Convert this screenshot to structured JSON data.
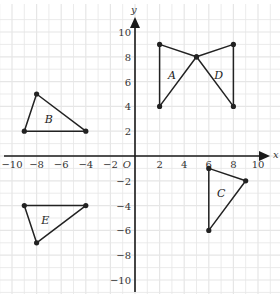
{
  "chart_data": {
    "type": "scatter",
    "title": "",
    "xlabel": "x",
    "ylabel": "y",
    "xlim": [
      -10,
      10
    ],
    "ylim": [
      -10,
      10
    ],
    "grid": true,
    "x_ticks": [
      -10,
      -8,
      -6,
      -4,
      -2,
      2,
      4,
      6,
      8,
      10
    ],
    "y_ticks": [
      -10,
      -8,
      -6,
      -4,
      -2,
      2,
      4,
      6,
      8,
      10
    ],
    "origin_label": "O",
    "shapes": [
      {
        "name": "A",
        "type": "triangle",
        "vertices": [
          [
            2,
            9
          ],
          [
            5,
            8
          ],
          [
            2,
            4
          ]
        ],
        "label_pos": [
          3,
          6.5
        ]
      },
      {
        "name": "B",
        "type": "triangle",
        "vertices": [
          [
            -8,
            5
          ],
          [
            -4,
            2
          ],
          [
            -9,
            2
          ]
        ],
        "label_pos": [
          -7,
          3
        ]
      },
      {
        "name": "C",
        "type": "triangle",
        "vertices": [
          [
            6,
            -1
          ],
          [
            9,
            -2
          ],
          [
            6,
            -6
          ]
        ],
        "label_pos": [
          7,
          -3
        ]
      },
      {
        "name": "D",
        "type": "triangle",
        "vertices": [
          [
            5,
            8
          ],
          [
            8,
            9
          ],
          [
            8,
            4
          ]
        ],
        "label_pos": [
          6.8,
          6.5
        ]
      },
      {
        "name": "E",
        "type": "triangle",
        "vertices": [
          [
            -9,
            -4
          ],
          [
            -4,
            -4
          ],
          [
            -8,
            -7
          ]
        ],
        "label_pos": [
          -7.3,
          -5.2
        ]
      }
    ]
  },
  "colors": {
    "grid": "#e6e6e6",
    "axis": "#1a1a1a",
    "shape": "#222222"
  }
}
